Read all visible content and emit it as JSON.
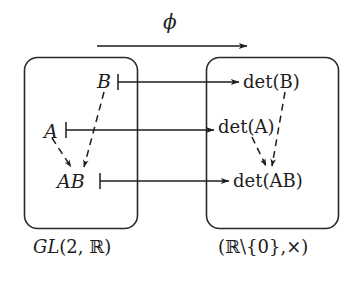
{
  "diagram": {
    "background_color": "#ffffff",
    "ink_color": "#1d1d1d",
    "map_label": "ϕ",
    "left_group": {
      "caption_gl": "GL",
      "caption_args": "(2, ",
      "caption_field": "ℝ",
      "caption_close": ")",
      "elements": {
        "a": "A",
        "b": "B",
        "ab": "AB"
      }
    },
    "right_group": {
      "caption_open": "(",
      "caption_field": "ℝ",
      "caption_excl": "\\{0},",
      "caption_op": "×",
      "caption_close": ")",
      "elements": {
        "det_a": "det(A)",
        "det_b": "det(B)",
        "det_ab": "det(AB)"
      }
    },
    "maplets": [
      {
        "from": "B",
        "to": "det(B)"
      },
      {
        "from": "A",
        "to": "det(A)"
      },
      {
        "from": "AB",
        "to": "det(AB)"
      }
    ],
    "operation_arrows": [
      {
        "from": "A",
        "to": "AB",
        "style": "dashed"
      },
      {
        "from": "B",
        "to": "AB",
        "style": "dashed"
      },
      {
        "from": "det(A)",
        "to": "det(AB)",
        "style": "dashed"
      },
      {
        "from": "det(B)",
        "to": "det(AB)",
        "style": "dashed"
      }
    ]
  }
}
